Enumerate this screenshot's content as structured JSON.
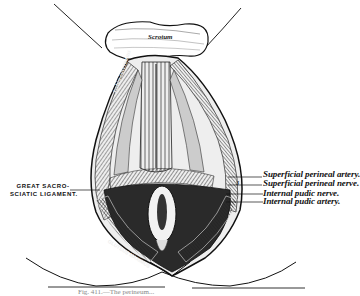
{
  "figure": {
    "type": "anatomical-illustration",
    "inner_labels": {
      "top": "Scrotum",
      "left_muscle": "Ischio-cavernosus",
      "right_muscle_partial": "S",
      "bottom_left_muscle": "GLUTEUS MAXIMUS",
      "right_small": "3"
    },
    "right_labels": [
      {
        "text": "Superficial perineal artery."
      },
      {
        "text": "Superficial perineal nerve."
      },
      {
        "text": "Internal pudic nerve."
      },
      {
        "text": "Internal pudic artery."
      }
    ],
    "left_label": {
      "line1": "GREAT SACRO-",
      "line2": "SCIATIC LIGAMENT."
    },
    "caption": "Fig. 411.—The perineum..."
  }
}
